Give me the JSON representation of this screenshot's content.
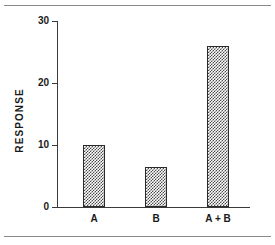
{
  "figure": {
    "top_rule": "",
    "bottom_rule": ""
  },
  "chart_data": {
    "type": "bar",
    "title": "",
    "subtitle": "",
    "xlabel": "",
    "ylabel": "RESPONSE",
    "categories": [
      "A",
      "B",
      "A + B"
    ],
    "values": [
      10,
      6.5,
      26
    ],
    "ylim": [
      0,
      30
    ],
    "yticks": [
      0,
      10,
      20,
      30
    ],
    "ytick_labels": [
      "0",
      "10",
      "20",
      "30"
    ],
    "grid": false,
    "legend": null,
    "bar_fill": "checkerboard-hatch",
    "bar_edge_color": "#2b2b2b",
    "bar_hatch_color": "#4a4a4a",
    "axis_color": "#3a3a3a",
    "text_color": "#1a1a1a",
    "background": "#ffffff",
    "annotations": []
  }
}
